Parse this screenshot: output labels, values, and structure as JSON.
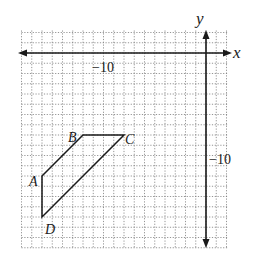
{
  "chart_data": {
    "type": "diagram",
    "title": "",
    "axes": {
      "x_label": "x",
      "y_label": "y",
      "x_range": [
        -18,
        2
      ],
      "y_range": [
        -19,
        2
      ],
      "grid": true,
      "tick_labels": [
        {
          "axis": "x",
          "value": -10,
          "text": "−10"
        },
        {
          "axis": "y",
          "value": -10,
          "text": "−10"
        }
      ]
    },
    "polygon": {
      "name": "ABCD",
      "vertices": [
        {
          "label": "A",
          "x": -16,
          "y": -12
        },
        {
          "label": "B",
          "x": -12,
          "y": -8
        },
        {
          "label": "C",
          "x": -8,
          "y": -8
        },
        {
          "label": "D",
          "x": -16,
          "y": -16
        }
      ]
    }
  },
  "labels": {
    "x_axis": "x",
    "y_axis": "y",
    "x_tick": "−10",
    "y_tick": "−10",
    "A": "A",
    "B": "B",
    "C": "C",
    "D": "D"
  }
}
